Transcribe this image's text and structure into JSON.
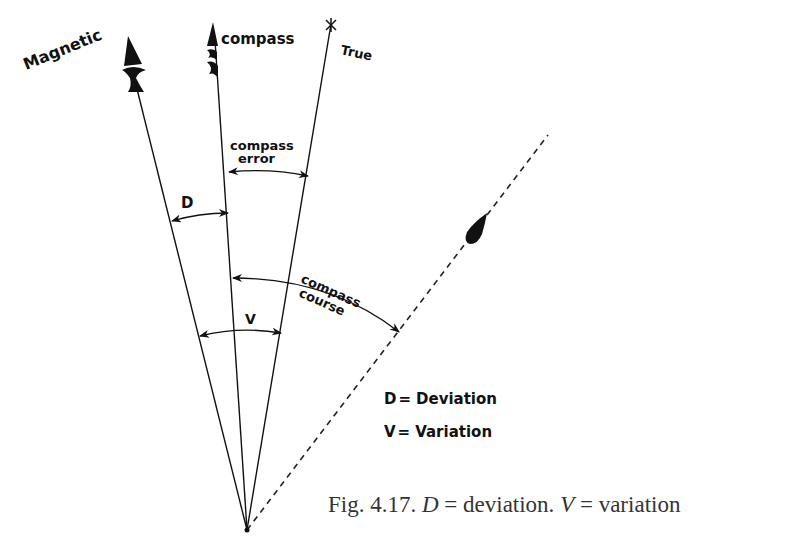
{
  "diagram": {
    "lines": {
      "magnetic": {
        "label": "Magnetic"
      },
      "compass": {
        "label": "compass"
      },
      "true": {
        "label": "True"
      }
    },
    "angles": {
      "deviation": {
        "label": "D"
      },
      "compass_error": {
        "label_line1": "compass",
        "label_line2": "error"
      },
      "compass_course": {
        "label_line1": "compass",
        "label_line2": "course"
      },
      "variation": {
        "label": "V"
      }
    },
    "legend": [
      {
        "symbol": "D",
        "sep": "=",
        "meaning": "Deviation"
      },
      {
        "symbol": "V",
        "sep": "=",
        "meaning": "Variation"
      }
    ],
    "colors": {
      "ink": "#111111",
      "caption": "#333333",
      "background": "#ffffff"
    }
  },
  "caption": {
    "prefix": "Fig. 4.17. ",
    "d_symbol": "D",
    "d_text": " = deviation. ",
    "v_symbol": "V",
    "v_text": " = variation"
  }
}
